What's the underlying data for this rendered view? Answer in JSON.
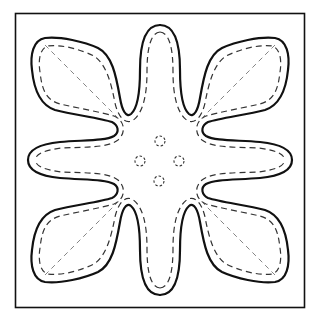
{
  "pattern": {
    "title": "Eight-petal appliqué quilt block pattern",
    "description": "Square frame containing an eight-petal flower outline with inner dashed stitch line, diagonal dashed fold lines in corner petals, and four small dashed circles at the center",
    "colors": {
      "background": "#ffffff",
      "ink": "#111111",
      "dash": "#333333",
      "fold": "#777777"
    },
    "frame": {
      "x": 15,
      "y": 13,
      "width": 290,
      "height": 295
    },
    "center": {
      "x": 160,
      "y": 160
    },
    "petal_count": 8,
    "center_dots": [
      {
        "cx": 160,
        "cy": 141,
        "r": 5
      },
      {
        "cx": 140,
        "cy": 161,
        "r": 5
      },
      {
        "cx": 179,
        "cy": 161,
        "r": 5
      },
      {
        "cx": 159,
        "cy": 181,
        "r": 5
      }
    ]
  }
}
